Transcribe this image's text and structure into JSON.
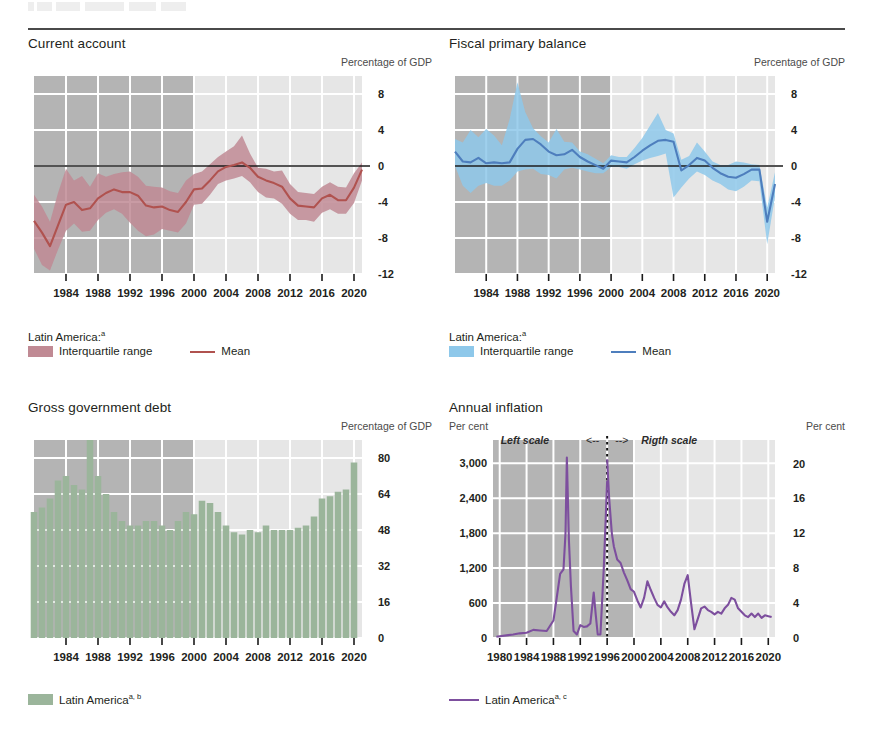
{
  "page": {
    "rule_visible": true,
    "cut_off_heading_above": true
  },
  "colors": {
    "shade_early": "#b4b4b4",
    "shade_late": "#e6e6e6",
    "gridline": "#ffffff",
    "zero_line": "#1a1a1a",
    "current_account_band": "#c08a94",
    "current_account_line": "#b0524f",
    "fiscal_band": "#8ec8ea",
    "fiscal_line": "#4e7ebd",
    "debt_bar": "#9bb59b",
    "inflation_line": "#7d4f9e",
    "text": "#231f20"
  },
  "panels": {
    "current_account": {
      "title": "Current account",
      "unit_right": "Percentage of GDP",
      "legend_head": "Latin America:",
      "legend_head_sup": "a",
      "legend_range": "Interquartile range",
      "legend_mean": "Mean"
    },
    "fiscal_primary_balance": {
      "title": "Fiscal primary balance",
      "unit_right": "Percentage of GDP",
      "legend_head": "Latin America:",
      "legend_head_sup": "a",
      "legend_range": "Interquartile range",
      "legend_mean": "Mean"
    },
    "gross_government_debt": {
      "title": "Gross government debt",
      "unit_right": "Percentage of GDP",
      "legend_label": "Latin America",
      "legend_sup": "a, b"
    },
    "annual_inflation": {
      "title": "Annual inflation",
      "unit_left": "Per cent",
      "unit_right": "Per cent",
      "note_left": "Left scale",
      "note_left_arrow": "<--",
      "note_right_arrow": "-->",
      "note_right": "Rigth scale",
      "legend_label": "Latin America",
      "legend_sup": "a, c"
    }
  },
  "chart_data": [
    {
      "id": "current-account",
      "type": "area",
      "title": "Current account",
      "ylabel": "Percentage of GDP",
      "xlabel": "",
      "ylim": [
        -12,
        10
      ],
      "yticks": [
        8,
        4,
        0,
        -4,
        -8,
        -12
      ],
      "ytick_labels": [
        "8",
        "4",
        "0",
        "-4",
        "-8",
        "-12"
      ],
      "xlim": [
        1980,
        2021
      ],
      "xticks": [
        1984,
        1988,
        1992,
        1996,
        2000,
        2004,
        2008,
        2012,
        2016,
        2020
      ],
      "xtick_labels": [
        "1984",
        "1988",
        "1992",
        "1996",
        "2000",
        "2004",
        "2008",
        "2012",
        "2016",
        "2020"
      ],
      "grid": true,
      "shaded_region": [
        1980,
        2000
      ],
      "zero_line": 0,
      "legend": [
        "Interquartile range",
        "Mean"
      ],
      "legend_position": "below",
      "x": [
        1980,
        1981,
        1982,
        1983,
        1984,
        1985,
        1986,
        1987,
        1988,
        1989,
        1990,
        1991,
        1992,
        1993,
        1994,
        1995,
        1996,
        1997,
        1998,
        1999,
        2000,
        2001,
        2002,
        2003,
        2004,
        2005,
        2006,
        2007,
        2008,
        2009,
        2010,
        2011,
        2012,
        2013,
        2014,
        2015,
        2016,
        2017,
        2018,
        2019,
        2020,
        2021
      ],
      "series": [
        {
          "name": "Mean",
          "values": [
            -6.1,
            -7.4,
            -8.9,
            -6.6,
            -4.3,
            -4.0,
            -4.9,
            -4.7,
            -3.6,
            -3.0,
            -2.6,
            -2.9,
            -2.9,
            -3.3,
            -4.4,
            -4.6,
            -4.5,
            -4.9,
            -5.1,
            -4.0,
            -2.6,
            -2.5,
            -1.6,
            -0.6,
            -0.1,
            0.1,
            0.4,
            -0.2,
            -1.2,
            -1.6,
            -1.9,
            -2.3,
            -3.6,
            -4.4,
            -4.5,
            -4.6,
            -3.6,
            -3.2,
            -3.8,
            -3.8,
            -2.4,
            -0.4
          ]
        },
        {
          "name": "Interquartile range upper",
          "values": [
            -3.2,
            -4.5,
            -6.2,
            -3.0,
            -0.3,
            -1.6,
            -1.1,
            -2.3,
            -0.8,
            -1.2,
            -0.9,
            -0.7,
            -0.6,
            -1.2,
            -2.2,
            -2.3,
            -2.4,
            -2.8,
            -3.0,
            -1.6,
            -0.9,
            -0.6,
            0.2,
            1.0,
            1.6,
            2.2,
            3.4,
            1.4,
            -0.2,
            -0.3,
            -0.6,
            -0.5,
            -2.0,
            -2.9,
            -3.0,
            -3.1,
            -2.3,
            -1.8,
            -2.3,
            -2.4,
            -0.8,
            0.4
          ]
        },
        {
          "name": "Interquartile range lower",
          "values": [
            -9.2,
            -11.0,
            -11.6,
            -9.3,
            -7.2,
            -6.4,
            -7.3,
            -7.2,
            -6.0,
            -5.2,
            -4.8,
            -5.3,
            -6.3,
            -7.2,
            -7.8,
            -7.6,
            -7.0,
            -7.2,
            -7.4,
            -6.4,
            -4.3,
            -4.2,
            -3.2,
            -2.0,
            -1.6,
            -1.4,
            -1.1,
            -1.8,
            -2.9,
            -3.5,
            -3.6,
            -4.2,
            -5.3,
            -6.0,
            -6.0,
            -6.2,
            -5.2,
            -4.8,
            -5.3,
            -5.3,
            -4.1,
            -1.6
          ]
        }
      ]
    },
    {
      "id": "fiscal-primary-balance",
      "type": "area",
      "title": "Fiscal primary balance",
      "ylabel": "Percentage of GDP",
      "xlabel": "",
      "ylim": [
        -12,
        10
      ],
      "yticks": [
        8,
        4,
        0,
        -4,
        -8,
        -12
      ],
      "ytick_labels": [
        "8",
        "4",
        "0",
        "-4",
        "-8",
        "-12"
      ],
      "xlim": [
        1980,
        2021
      ],
      "xticks": [
        1984,
        1988,
        1992,
        1996,
        2000,
        2004,
        2008,
        2012,
        2016,
        2020
      ],
      "xtick_labels": [
        "1984",
        "1988",
        "1992",
        "1996",
        "2000",
        "2004",
        "2008",
        "2012",
        "2016",
        "2020"
      ],
      "grid": true,
      "shaded_region": [
        1980,
        2000
      ],
      "zero_line": 0,
      "legend": [
        "Interquartile range",
        "Mean"
      ],
      "legend_position": "below",
      "x": [
        1980,
        1981,
        1982,
        1983,
        1984,
        1985,
        1986,
        1987,
        1988,
        1989,
        1990,
        1991,
        1992,
        1993,
        1994,
        1995,
        1996,
        1997,
        1998,
        1999,
        2000,
        2001,
        2002,
        2003,
        2004,
        2005,
        2006,
        2007,
        2008,
        2009,
        2010,
        2011,
        2012,
        2013,
        2014,
        2015,
        2016,
        2017,
        2018,
        2019,
        2020,
        2021
      ],
      "series": [
        {
          "name": "Mean",
          "values": [
            1.6,
            0.5,
            0.4,
            0.9,
            0.3,
            0.4,
            0.3,
            0.4,
            1.9,
            2.9,
            3.0,
            2.4,
            1.6,
            1.2,
            1.3,
            1.8,
            1.0,
            0.5,
            0.1,
            -0.3,
            0.6,
            0.5,
            0.4,
            1.0,
            1.7,
            2.3,
            2.8,
            2.9,
            2.7,
            -0.5,
            0.1,
            0.9,
            0.6,
            -0.2,
            -0.8,
            -1.2,
            -1.3,
            -0.9,
            -0.4,
            -0.4,
            -6.2,
            -2.0
          ]
        },
        {
          "name": "Interquartile range upper",
          "values": [
            3.0,
            2.6,
            4.0,
            3.2,
            4.1,
            3.4,
            2.3,
            5.2,
            9.3,
            6.0,
            4.2,
            3.3,
            2.6,
            4.1,
            2.7,
            2.6,
            1.6,
            1.3,
            0.8,
            0.3,
            1.2,
            1.0,
            1.0,
            2.0,
            3.1,
            4.5,
            5.9,
            4.0,
            3.6,
            0.7,
            1.1,
            2.6,
            1.6,
            0.5,
            0.1,
            0.1,
            0.5,
            0.4,
            0.2,
            0.1,
            -4.6,
            -0.7
          ]
        },
        {
          "name": "Interquartile range lower",
          "values": [
            0.0,
            -2.2,
            -3.0,
            -2.2,
            -1.9,
            -2.2,
            -2.2,
            -1.6,
            -0.6,
            -0.4,
            -0.3,
            -0.9,
            -1.0,
            -1.4,
            -0.4,
            -0.2,
            -0.4,
            -0.6,
            -0.8,
            -0.8,
            -0.1,
            -0.1,
            -0.3,
            0.2,
            0.6,
            0.9,
            1.1,
            1.4,
            -3.5,
            -2.4,
            -1.4,
            -0.6,
            -1.0,
            -1.6,
            -2.0,
            -2.6,
            -2.8,
            -2.3,
            -1.6,
            -1.7,
            -8.7,
            -3.4
          ]
        }
      ]
    },
    {
      "id": "gross-government-debt",
      "type": "bar",
      "title": "Gross government debt",
      "ylabel": "Percentage of GDP",
      "xlabel": "",
      "ylim": [
        0,
        88
      ],
      "yticks": [
        80,
        64,
        48,
        32,
        16,
        0
      ],
      "ytick_labels": [
        "80",
        "64",
        "48",
        "32",
        "16",
        "0"
      ],
      "xlim": [
        1980,
        2021
      ],
      "xticks": [
        1984,
        1988,
        1992,
        1996,
        2000,
        2004,
        2008,
        2012,
        2016,
        2020
      ],
      "xtick_labels": [
        "1984",
        "1988",
        "1992",
        "1996",
        "2000",
        "2004",
        "2008",
        "2012",
        "2016",
        "2020"
      ],
      "grid": true,
      "shaded_region": [
        1980,
        2000
      ],
      "legend": [
        "Latin America"
      ],
      "legend_position": "below",
      "categories": [
        1980,
        1981,
        1982,
        1983,
        1984,
        1985,
        1986,
        1987,
        1988,
        1989,
        1990,
        1991,
        1992,
        1993,
        1994,
        1995,
        1996,
        1997,
        1998,
        1999,
        2000,
        2001,
        2002,
        2003,
        2004,
        2005,
        2006,
        2007,
        2008,
        2009,
        2010,
        2011,
        2012,
        2013,
        2014,
        2015,
        2016,
        2017,
        2018,
        2019,
        2020
      ],
      "values": [
        56,
        58,
        62,
        70,
        72,
        68,
        66,
        88,
        72,
        64,
        56,
        52,
        50,
        50,
        52,
        52,
        50,
        48,
        52,
        56,
        55,
        61,
        60,
        56,
        50,
        47,
        46,
        48,
        47,
        50,
        48,
        48,
        48,
        49,
        50,
        54,
        62,
        63,
        65,
        66,
        78
      ]
    },
    {
      "id": "annual-inflation",
      "type": "line",
      "title": "Annual inflation",
      "ylabel_left": "Per cent",
      "ylabel_right": "Per cent",
      "note": "Left scale <--  --> Rigth scale",
      "break_year": 1996,
      "ylim_left": [
        0,
        3400
      ],
      "yticks_left": [
        3000,
        2400,
        1800,
        1200,
        600,
        0
      ],
      "ytick_labels_left": [
        "3,000",
        "2,400",
        "1,800",
        "1,200",
        "600",
        "0"
      ],
      "ylim_right": [
        0,
        22.7
      ],
      "yticks_right": [
        20,
        16,
        12,
        8,
        4,
        0
      ],
      "ytick_labels_right": [
        "20",
        "16",
        "12",
        "8",
        "4",
        "0"
      ],
      "xlim": [
        1979,
        2021
      ],
      "xticks": [
        1980,
        1984,
        1988,
        1992,
        1996,
        2000,
        2004,
        2008,
        2012,
        2016,
        2020
      ],
      "xtick_labels": [
        "1980",
        "1984",
        "1988",
        "1992",
        "1996",
        "2000",
        "2004",
        "2008",
        "2012",
        "2016",
        "2020"
      ],
      "grid": true,
      "shaded_region": [
        1980,
        2000
      ],
      "legend": [
        "Latin America"
      ],
      "legend_position": "below",
      "left_scale_x": [
        1979.5,
        1980,
        1981,
        1982,
        1983,
        1984,
        1985,
        1986,
        1987,
        1988,
        1988.5,
        1989,
        1989.5,
        1989.8,
        1990,
        1990.3,
        1990.6,
        1991,
        1991.5,
        1992,
        1992.5,
        1993,
        1993.5,
        1994,
        1994.3,
        1994.6,
        1995,
        1995.5,
        1996
      ],
      "left_scale_y": [
        20,
        30,
        45,
        60,
        80,
        90,
        140,
        130,
        120,
        300,
        700,
        1100,
        1180,
        1800,
        3100,
        1700,
        900,
        120,
        60,
        220,
        190,
        200,
        250,
        780,
        400,
        60,
        60,
        1200,
        2700
      ],
      "right_scale_x": [
        1996,
        1996.3,
        1996.7,
        1997,
        1997.5,
        1998,
        1998.5,
        1999,
        1999.5,
        2000,
        2000.5,
        2001,
        2001.5,
        2002,
        2002.5,
        2003,
        2003.5,
        2004,
        2004.5,
        2005,
        2005.5,
        2006,
        2006.5,
        2007,
        2007.5,
        2008,
        2008.5,
        2009,
        2009.5,
        2010,
        2010.5,
        2011,
        2011.5,
        2012,
        2012.5,
        2013,
        2013.5,
        2014,
        2014.5,
        2015,
        2015.5,
        2016,
        2016.5,
        2017,
        2017.5,
        2018,
        2018.5,
        2019,
        2019.5,
        2020,
        2020.5
      ],
      "right_scale_y": [
        20.5,
        16,
        12,
        10.5,
        9.0,
        8.6,
        7.5,
        6.6,
        5.6,
        5.3,
        4.3,
        3.5,
        4.6,
        6.5,
        5.5,
        4.6,
        3.8,
        3.5,
        4.2,
        3.5,
        3.0,
        2.6,
        3.2,
        4.4,
        6.2,
        7.2,
        4.0,
        1.0,
        2.2,
        3.4,
        3.6,
        3.2,
        3.0,
        2.7,
        3.0,
        2.8,
        3.4,
        3.8,
        4.6,
        4.4,
        3.4,
        3.0,
        2.6,
        2.4,
        2.8,
        2.4,
        2.8,
        2.3,
        2.6,
        2.5,
        2.4
      ]
    }
  ]
}
